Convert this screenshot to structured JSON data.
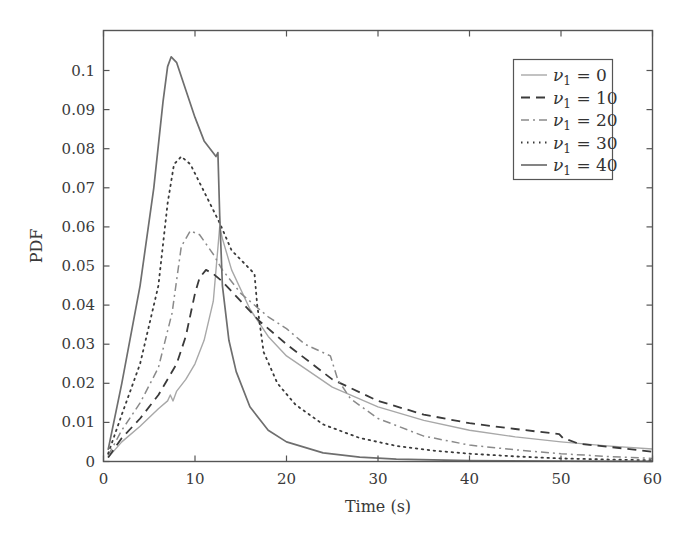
{
  "chart_data": {
    "type": "line",
    "title": "",
    "xlabel": "Time (s)",
    "ylabel": "PDF",
    "xlim": [
      0,
      60
    ],
    "ylim": [
      0,
      0.11
    ],
    "xticks": [
      0,
      10,
      20,
      30,
      40,
      50,
      60
    ],
    "yticks": [
      0,
      0.01,
      0.02,
      0.03,
      0.04,
      0.05,
      0.06,
      0.07,
      0.08,
      0.09,
      0.1
    ],
    "xtick_labels": [
      "0",
      "10",
      "20",
      "30",
      "40",
      "50",
      "60"
    ],
    "ytick_labels": [
      "0",
      "0.01",
      "0.02",
      "0.03",
      "0.04",
      "0.05",
      "0.06",
      "0.07",
      "0.08",
      "0.09",
      "0.1"
    ],
    "grid": false,
    "legend_position": "upper right",
    "series": [
      {
        "name": "ν1 = 0",
        "label_var": "ν",
        "label_sub": "1",
        "label_val": "0",
        "style": "solid",
        "color": "#a8a8a8",
        "width": 1.4,
        "x": [
          0.5,
          2,
          4,
          6,
          7,
          7.3,
          7.6,
          8,
          9,
          10,
          11,
          12,
          12.7,
          13,
          14,
          16,
          18,
          20,
          25,
          30,
          35,
          40,
          45,
          50,
          55,
          60
        ],
        "y": [
          0.001,
          0.005,
          0.009,
          0.0135,
          0.0155,
          0.017,
          0.0155,
          0.018,
          0.021,
          0.025,
          0.031,
          0.041,
          0.06,
          0.057,
          0.049,
          0.039,
          0.032,
          0.027,
          0.019,
          0.014,
          0.0105,
          0.008,
          0.0063,
          0.005,
          0.004,
          0.0032
        ]
      },
      {
        "name": "ν1 = 10",
        "label_var": "ν",
        "label_sub": "1",
        "label_val": "10",
        "style": "dashed",
        "color": "#3a3a3a",
        "width": 1.8,
        "x": [
          0.5,
          2,
          4,
          6,
          8,
          9,
          10,
          10.5,
          11.2,
          12,
          13,
          15,
          17,
          20,
          25,
          30,
          35,
          40,
          45,
          49.8,
          50.2,
          52,
          55,
          60
        ],
        "y": [
          0.001,
          0.006,
          0.011,
          0.017,
          0.025,
          0.032,
          0.043,
          0.047,
          0.049,
          0.048,
          0.046,
          0.041,
          0.036,
          0.03,
          0.021,
          0.0155,
          0.012,
          0.0098,
          0.0083,
          0.007,
          0.006,
          0.0045,
          0.0038,
          0.0025
        ]
      },
      {
        "name": "ν1 = 20",
        "label_var": "ν",
        "label_sub": "1",
        "label_val": "20",
        "style": "dashdot",
        "color": "#8a8a8a",
        "width": 1.5,
        "x": [
          0.5,
          2,
          4,
          6,
          7.5,
          8.5,
          9.5,
          10.5,
          12,
          13,
          15,
          18,
          20,
          22,
          24.8,
          25.6,
          27,
          30,
          35,
          40,
          45,
          50,
          55,
          60
        ],
        "y": [
          0.0015,
          0.008,
          0.015,
          0.024,
          0.038,
          0.055,
          0.059,
          0.058,
          0.053,
          0.049,
          0.043,
          0.037,
          0.034,
          0.03,
          0.027,
          0.021,
          0.016,
          0.011,
          0.0065,
          0.0042,
          0.003,
          0.002,
          0.0013,
          0.0008
        ]
      },
      {
        "name": "ν1 = 30",
        "label_var": "ν",
        "label_sub": "1",
        "label_val": "30",
        "style": "dotted",
        "color": "#3a3a3a",
        "width": 1.8,
        "x": [
          0.5,
          2,
          4,
          6,
          7,
          7.7,
          8.5,
          9.5,
          11,
          12.7,
          14,
          16.5,
          16.8,
          17.5,
          19,
          21,
          24,
          28,
          32,
          36,
          40,
          45,
          50,
          55,
          60
        ],
        "y": [
          0.002,
          0.012,
          0.025,
          0.045,
          0.066,
          0.076,
          0.078,
          0.076,
          0.069,
          0.061,
          0.054,
          0.048,
          0.04,
          0.028,
          0.02,
          0.0145,
          0.0095,
          0.006,
          0.004,
          0.0028,
          0.002,
          0.0013,
          0.0008,
          0.0005,
          0.0003
        ]
      },
      {
        "name": "ν1 = 40",
        "label_var": "ν",
        "label_sub": "1",
        "label_val": "40",
        "style": "solid",
        "color": "#6e6e6e",
        "width": 1.7,
        "x": [
          0.5,
          2,
          4,
          5.5,
          6.5,
          7,
          7.4,
          8,
          9,
          10,
          11,
          12.3,
          12.5,
          12.7,
          13,
          13.7,
          14.5,
          16,
          18,
          20,
          24,
          28,
          32,
          40,
          50,
          60
        ],
        "y": [
          0.003,
          0.02,
          0.045,
          0.07,
          0.092,
          0.101,
          0.1035,
          0.102,
          0.095,
          0.088,
          0.082,
          0.078,
          0.079,
          0.063,
          0.045,
          0.031,
          0.023,
          0.014,
          0.008,
          0.005,
          0.0022,
          0.0011,
          0.0006,
          0.0002,
          0.0001,
          5e-05
        ]
      }
    ]
  }
}
